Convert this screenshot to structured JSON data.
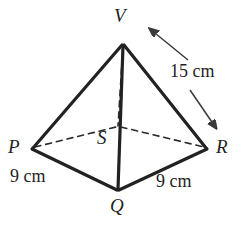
{
  "figure": {
    "stroke_color": "#262626",
    "background_color": "#ffffff",
    "vertices": [
      {
        "name": "V",
        "label": "V",
        "x": 123,
        "y": 44,
        "role": "apex"
      },
      {
        "name": "P",
        "label": "P",
        "x": 32,
        "y": 148,
        "role": "base-corner"
      },
      {
        "name": "Q",
        "label": "Q",
        "x": 118,
        "y": 190,
        "role": "base-corner"
      },
      {
        "name": "R",
        "label": "R",
        "x": 207,
        "y": 148,
        "role": "base-corner"
      },
      {
        "name": "S",
        "label": "S",
        "x": 118,
        "y": 127,
        "role": "base-corner-hidden"
      }
    ],
    "edges": [
      {
        "from": "V",
        "to": "P",
        "style": "solid"
      },
      {
        "from": "V",
        "to": "Q",
        "style": "solid"
      },
      {
        "from": "V",
        "to": "R",
        "style": "solid"
      },
      {
        "from": "V",
        "to": "S",
        "style": "dashed"
      },
      {
        "from": "P",
        "to": "Q",
        "style": "solid"
      },
      {
        "from": "Q",
        "to": "R",
        "style": "solid"
      },
      {
        "from": "P",
        "to": "S",
        "style": "dashed"
      },
      {
        "from": "S",
        "to": "R",
        "style": "dashed"
      }
    ],
    "measurements": [
      {
        "name": "slant-edge",
        "text": "15 cm",
        "applies_to": "VR",
        "x": 170,
        "y": 62
      },
      {
        "name": "base-edge-left",
        "text": "9 cm",
        "applies_to": "PQ",
        "x": 10,
        "y": 167
      },
      {
        "name": "base-edge-right",
        "text": "9 cm",
        "applies_to": "QR",
        "x": 156,
        "y": 172
      }
    ],
    "annotation_arrows": [
      {
        "name": "arrow-to-V",
        "from_x": 188,
        "from_y": 60,
        "to_x": 147,
        "to_y": 26
      },
      {
        "name": "arrow-to-R",
        "from_x": 190,
        "from_y": 90,
        "to_x": 219,
        "to_y": 132
      }
    ]
  }
}
